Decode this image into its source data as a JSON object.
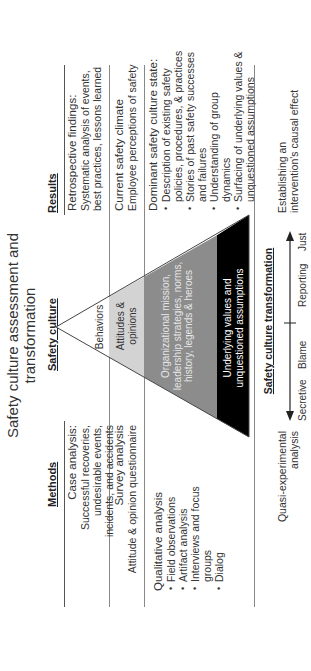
{
  "title": "Safety culture assessment and transformation",
  "title_lines": [
    "Safety culture assessment and",
    "transformation"
  ],
  "columns": {
    "methods": "Methods",
    "safety_culture": "Safety culture",
    "results": "Results"
  },
  "rows": [
    {
      "method_title": "Case analysis:",
      "method_lines": [
        "Successful recoveries,",
        "undesirable events,",
        "incidents, and accidents"
      ],
      "result_title": "Retrospective findings:",
      "result_lines": [
        "Systematic analysis of events,",
        "best practices, lessons learned"
      ]
    },
    {
      "method_title": "Survey analysis",
      "method_lines": [
        "Attitude & opinion questionnaire"
      ],
      "result_title": "Current safety climate",
      "result_lines": [
        "Employee perceptions of safety"
      ]
    },
    {
      "method_title": "Qualitative analysis",
      "method_bullets": [
        "Field observations",
        "Artifact analysis",
        "Interviews and focus groups",
        "Dialog"
      ],
      "result_title": "Dominant safety culture state:",
      "result_bullets": [
        "Description of existing safety policies, procedures, & practices",
        "Stories of past safety successes and failures",
        "Understanding of group dynamics",
        "Surfacing of underlying values & unquestioned assumptions"
      ]
    }
  ],
  "pyramid": {
    "layers": [
      {
        "label": "Behaviors",
        "fill": "#ffffff",
        "text_color": "#333333"
      },
      {
        "label": "Attitudes & opinions",
        "lines": [
          "Attitudes &",
          "opinions"
        ],
        "fill": "#d3d3d3",
        "text_color": "#333333"
      },
      {
        "label": "Organizational mission, leadership strategies, norms, history, legends & heroes",
        "lines": [
          "Organizational mission,",
          "leadership strategies, norms,",
          "history, legends & heroes"
        ],
        "fill": "#8c8c8c",
        "text_color": "#e6e6e6"
      },
      {
        "label": "Underlying values and unquestioned assumptions",
        "lines": [
          "Underlying values and",
          "unquestioned assumptions"
        ],
        "fill": "#000000",
        "text_color": "#ffffff"
      }
    ]
  },
  "transformation": {
    "left_label_lines": [
      "Quasi-experimental",
      "analysis"
    ],
    "heading": "Safety culture transformation",
    "scale": [
      "Secretive",
      "Blame",
      "Reporting",
      "Just"
    ],
    "right_label_lines": [
      "Establishing an",
      "intervention's causal effect"
    ]
  }
}
